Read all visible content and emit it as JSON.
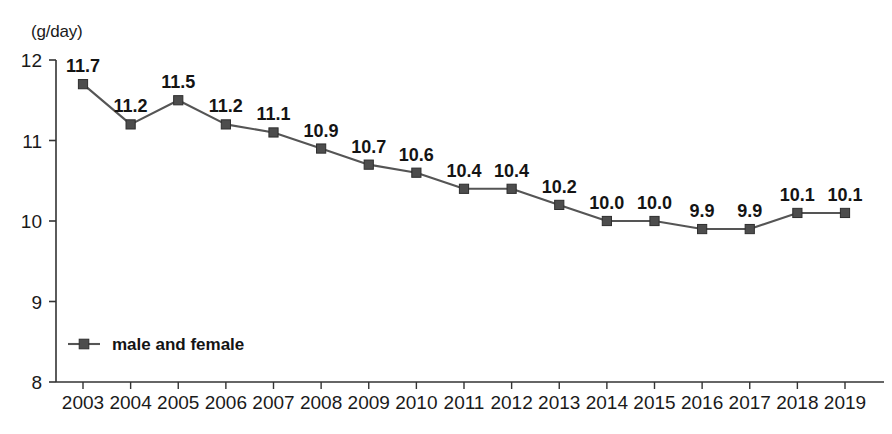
{
  "chart_data": {
    "type": "line",
    "title": "",
    "subtitle": "",
    "xlabel": "",
    "ylabel": "(g/day)",
    "unit_label": "(g/day)",
    "categories": [
      "2003",
      "2004",
      "2005",
      "2006",
      "2007",
      "2008",
      "2009",
      "2010",
      "2011",
      "2012",
      "2013",
      "2014",
      "2015",
      "2016",
      "2017",
      "2018",
      "2019"
    ],
    "x": [
      2003,
      2004,
      2005,
      2006,
      2007,
      2008,
      2009,
      2010,
      2011,
      2012,
      2013,
      2014,
      2015,
      2016,
      2017,
      2018,
      2019
    ],
    "series": [
      {
        "name": "male and female",
        "values": [
          11.7,
          11.2,
          11.5,
          11.2,
          11.1,
          10.9,
          10.7,
          10.6,
          10.4,
          10.4,
          10.2,
          10.0,
          10.0,
          9.9,
          9.9,
          10.1,
          10.1
        ],
        "labels": [
          "11.7",
          "11.2",
          "11.5",
          "11.2",
          "11.1",
          "10.9",
          "10.7",
          "10.6",
          "10.4",
          "10.4",
          "10.2",
          "10.0",
          "10.0",
          "9.9",
          "9.9",
          "10.1",
          "10.1"
        ],
        "color": "#555555",
        "marker": "square"
      }
    ],
    "ylim": [
      8,
      12
    ],
    "yticks": [
      8,
      9,
      10,
      11,
      12
    ],
    "ytick_labels": [
      "8",
      "9",
      "10",
      "11",
      "12"
    ],
    "grid": false,
    "legend_position": "inside-bottom-left",
    "legend": [
      "male and female"
    ],
    "axis_color": "#333333"
  }
}
